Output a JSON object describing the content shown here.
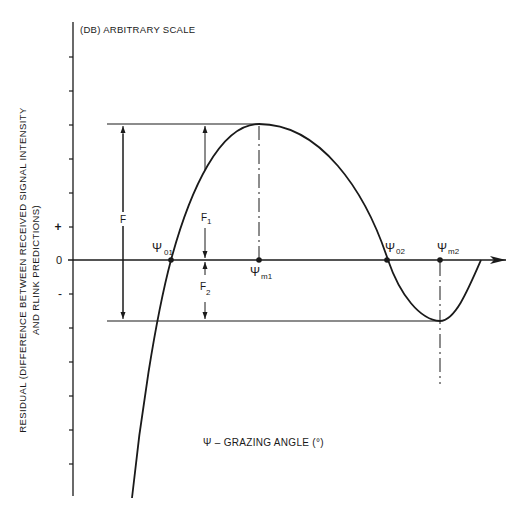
{
  "title": "(DB) ARBITRARY SCALE",
  "y_axis_label_line1": "RESIDUAL (DIFFERENCE BETWEEN RECEIVED SIGNAL INTENSITY",
  "y_axis_label_line2": "AND RLINK PREDICTIONS)",
  "x_axis_label": "Ψ – GRAZING ANGLE (°)",
  "y_ticks": {
    "plus": "+",
    "zero": "0",
    "minus": "-"
  },
  "points": {
    "psi01": {
      "base": "Ψ",
      "sub": "01"
    },
    "psi02": {
      "base": "Ψ",
      "sub": "02"
    },
    "psim1": {
      "base": "Ψ",
      "sub": "m1"
    },
    "psim2": {
      "base": "Ψ",
      "sub": "m2"
    }
  },
  "dimensions": {
    "F": {
      "base": "F",
      "sub": ""
    },
    "F1": {
      "base": "F",
      "sub": "1"
    },
    "F2": {
      "base": "F",
      "sub": "2"
    }
  },
  "colors": {
    "ink": "#1a1a1a",
    "background": "#ffffff"
  }
}
